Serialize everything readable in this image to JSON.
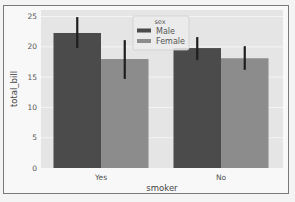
{
  "chart_data": {
    "type": "bar",
    "title": "",
    "xlabel": "smoker",
    "ylabel": "total_bill",
    "categories": [
      "Yes",
      "No"
    ],
    "series": [
      {
        "name": "Male",
        "values": [
          22.28,
          19.79
        ],
        "ci_low": [
          19.8,
          17.8
        ],
        "ci_high": [
          24.9,
          21.6
        ],
        "color": "#4b4b4b"
      },
      {
        "name": "Female",
        "values": [
          17.98,
          18.11
        ],
        "ci_low": [
          14.7,
          16.2
        ],
        "ci_high": [
          21.1,
          20.1
        ],
        "color": "#8c8c8c"
      }
    ],
    "ylim": [
      0,
      26
    ],
    "yticks": [
      0,
      5,
      10,
      15,
      20,
      25
    ],
    "grid": true,
    "legend": {
      "title": "sex",
      "position": "upper center",
      "entries": [
        "Male",
        "Female"
      ]
    },
    "background": "#e5e5e5",
    "grid_color": "#f4f4f4",
    "errorbar_color": "#1e1e1e"
  }
}
